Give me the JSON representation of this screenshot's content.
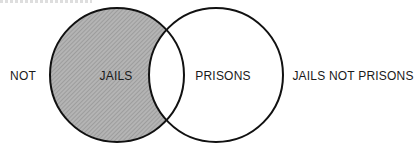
{
  "diagram": {
    "type": "venn",
    "sets": [
      {
        "name": "JAILS",
        "shaded": true
      },
      {
        "name": "PRISONS",
        "shaded": false
      }
    ],
    "labels": {
      "left_outside": "NOT",
      "left_set": "JAILS",
      "right_set": "PRISONS",
      "right_outside": "JAILS NOT PRISONS"
    },
    "colors": {
      "shade": "#a9a9a9",
      "outline": "#111111",
      "background": "#ffffff"
    }
  }
}
